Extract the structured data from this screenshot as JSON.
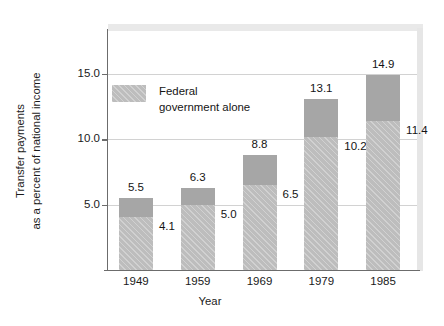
{
  "chart_data": {
    "type": "bar",
    "subtype": "stacked-bar",
    "title": "",
    "xlabel": "Year",
    "ylabel_lines": [
      "Transfer payments",
      "as a percent of national income"
    ],
    "categories": [
      "1949",
      "1959",
      "1969",
      "1979",
      "1985"
    ],
    "series": [
      {
        "name": "Total transfer payments",
        "values": [
          5.5,
          6.3,
          8.8,
          13.1,
          14.9
        ],
        "value_labels": [
          "5.5",
          "6.3",
          "8.8",
          "13.1",
          "14.9"
        ],
        "color": "#a6a6a6",
        "label_position": "above-bar"
      },
      {
        "name": "Federal government alone",
        "values": [
          4.1,
          5.0,
          6.5,
          10.2,
          11.4
        ],
        "value_labels": [
          "4.1",
          "5.0",
          "6.5",
          "10.2",
          "11.4"
        ],
        "color": "#bdbdbd",
        "label_position": "right-of-segment-top"
      }
    ],
    "ylim": [
      0,
      18.3
    ],
    "yticks": [
      5.0,
      10.0,
      15.0
    ],
    "ytick_labels": [
      "5.0",
      "10.0",
      "15.0"
    ],
    "grid": "horizontal-only",
    "legend": {
      "position": "inside-upper-left",
      "entries": [
        {
          "label_lines": [
            "Federal",
            "government alone"
          ],
          "swatch_color": "#bdbdbd"
        }
      ]
    },
    "axis_color": "#6c6c6c",
    "gridline_color": "#d2d2d2"
  },
  "legend": {
    "federal_line1": "Federal",
    "federal_line2": "government alone"
  },
  "axes": {
    "y_title_line1": "Transfer payments",
    "y_title_line2": "as a percent of national income",
    "x_title": "Year",
    "ytick_0": "5.0",
    "ytick_1": "10.0",
    "ytick_2": "15.0",
    "xtick_0": "1949",
    "xtick_1": "1959",
    "xtick_2": "1969",
    "xtick_3": "1979",
    "xtick_4": "1985"
  },
  "bars": [
    {
      "year": "1949",
      "total_label": "5.5",
      "federal_label": "4.1"
    },
    {
      "year": "1959",
      "total_label": "6.3",
      "federal_label": "5.0"
    },
    {
      "year": "1969",
      "total_label": "8.8",
      "federal_label": "6.5"
    },
    {
      "year": "1979",
      "total_label": "13.1",
      "federal_label": "10.2"
    },
    {
      "year": "1985",
      "total_label": "14.9",
      "federal_label": "11.4"
    }
  ]
}
